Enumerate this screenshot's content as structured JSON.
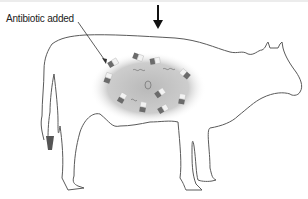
{
  "figure": {
    "annotation_label": "Antibiotic added",
    "elements": [
      "stomach-region",
      "antibiotic-capsules",
      "bacteria",
      "down-arrow"
    ],
    "colors": {
      "outline": "#555555",
      "stomach": "#c8c8c8",
      "capsule_dark": "#6b6b6b",
      "capsule_light": "#f2f2f2",
      "arrow": "#111111"
    }
  }
}
